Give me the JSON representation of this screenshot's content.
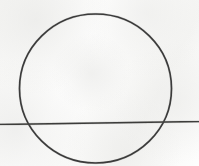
{
  "figure": {
    "title": "Circle with intersecting secant line",
    "description": "Hand-drawn geometry sketch: a large circle crossed near its lower third by an almost-horizontal straight line that extends past the circle on both sides to the image edges.",
    "medium": "ink line drawing on lightly textured off-white paper",
    "canvas": {
      "width": 199,
      "height": 166,
      "background_color": "#fbfbfa",
      "paper_tint": "#fcfcfb"
    },
    "ink": {
      "stroke_color": "#3a3a3a",
      "secondary_stroke_color": "#4a4a48",
      "circle_stroke_width": 1.6,
      "line_stroke_width": 1.7
    },
    "shapes": [
      {
        "name": "circle",
        "type": "circle",
        "center_x": 95.5,
        "center_y": 88.5,
        "radius_x": 76.0,
        "radius_y": 74.5,
        "bounds": {
          "left": 19,
          "top": 14,
          "right": 172,
          "bottom": 163
        },
        "stroke_color": "#3a3a3a",
        "fill": "none"
      },
      {
        "name": "secant-line",
        "type": "line",
        "x1": 0,
        "y1": 124.5,
        "x2": 199,
        "y2": 121.5,
        "stroke_color": "#3d3d3b",
        "orientation": "near-horizontal, slightly rising to the right"
      }
    ],
    "intersections": [
      {
        "name": "left-intersection",
        "x": 25,
        "y": 124
      },
      {
        "name": "right-intersection",
        "x": 168,
        "y": 122
      }
    ]
  }
}
